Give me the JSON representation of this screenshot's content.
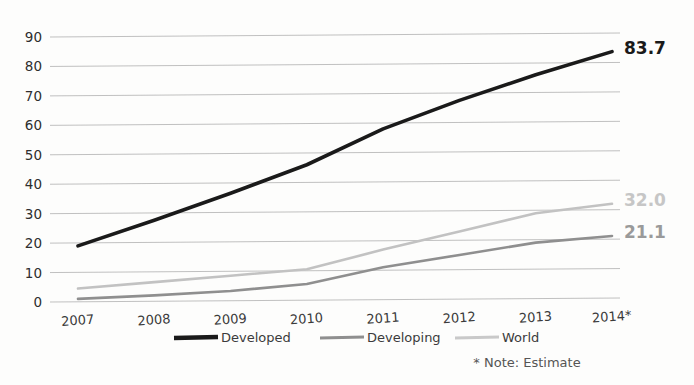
{
  "chart_data": {
    "type": "line",
    "title": "",
    "subtitle": "",
    "xlabel": "",
    "ylabel": "",
    "xlim": [
      2007,
      2014
    ],
    "ylim": [
      0,
      90
    ],
    "grid": true,
    "legend_position": "bottom",
    "categories": [
      "2007",
      "2008",
      "2009",
      "2010",
      "2011",
      "2012",
      "2013",
      "2014*"
    ],
    "yticks": [
      "90",
      "80",
      "70",
      "60",
      "50",
      "40",
      "30",
      "20",
      "10",
      "0"
    ],
    "ytick_values": [
      90,
      80,
      70,
      60,
      50,
      40,
      30,
      20,
      10,
      0
    ],
    "series": [
      {
        "name": "Developed",
        "color": "#1a1a1a",
        "width": 3.6,
        "values": [
          19.0,
          27.5,
          36.5,
          46.0,
          58.0,
          67.5,
          76.0,
          83.7
        ],
        "end_label": "83.7",
        "end_label_color": "#1a1a1a"
      },
      {
        "name": "Developing",
        "color": "#8f8f8f",
        "width": 2.6,
        "values": [
          1.0,
          2.0,
          3.3,
          5.5,
          11.0,
          15.0,
          19.0,
          21.1
        ],
        "end_label": "21.1",
        "end_label_color": "#9a9a9a"
      },
      {
        "name": "World",
        "color": "#c2c2c2",
        "width": 2.6,
        "values": [
          4.5,
          6.5,
          8.5,
          10.5,
          17.0,
          23.0,
          29.0,
          32.0
        ],
        "end_label": "32.0",
        "end_label_color": "#c6c6c6"
      }
    ],
    "annotations": [
      {
        "text": "* Note: Estimate"
      }
    ]
  },
  "legend": {
    "items": [
      {
        "label": "Developed",
        "color": "#1a1a1a",
        "width": 4.5
      },
      {
        "label": "Developing",
        "color": "#8f8f8f",
        "width": 3
      },
      {
        "label": "World",
        "color": "#c9c9c9",
        "width": 3
      }
    ]
  },
  "note": {
    "text": "* Note: Estimate"
  },
  "colors": {
    "background": "#fdfdfc",
    "gridline": "#b9b9b9",
    "axis_text": "#2e2e2e"
  }
}
